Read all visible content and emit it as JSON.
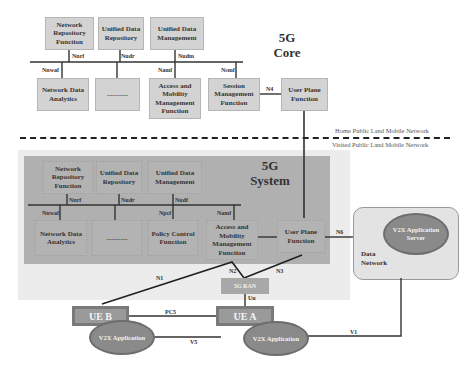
{
  "core": {
    "title_line1": "5G",
    "title_line2": "Core",
    "nrf": "Network Repository Function",
    "udr": "Unified Data Repository",
    "udm": "Unified Data Management",
    "nwdaf": "Network Data Analytics",
    "dots": "............",
    "amf": "Access and Mobility Management Function",
    "smf": "Session Management Function",
    "upf": "User Plane Function",
    "interfaces": {
      "nnrf": "Nnrf",
      "nudr": "Nudr",
      "nudm": "Nudm",
      "nnwaf": "Nnwaf",
      "namf": "Namf",
      "nsmf": "Nsmf",
      "n4": "N4"
    }
  },
  "boundary": {
    "home": "Home Public Land Mobile Network",
    "visited": "Visited Public Land Mobile Network"
  },
  "system": {
    "title_line1": "5G",
    "title_line2": "System",
    "nrf": "Network Repository Function",
    "udr": "Unified Data Repository",
    "udm": "Unified Data Management",
    "nwdaf": "Network Data Analytics",
    "dots": "............",
    "pcf": "Policy Control Function",
    "amf": "Access and Mobility Management Function",
    "upf": "User Plane Function",
    "interfaces": {
      "nnrf": "Nnrf",
      "nudr": "Nudr",
      "nudf": "Nudf",
      "nnwaf": "Nnwaf",
      "npcf": "Npcf",
      "namf": "Namf",
      "n6": "N6",
      "n1": "N1",
      "n2": "N2",
      "n3": "N3",
      "uu": "Uu",
      "pc5": "PC5",
      "v5": "V5",
      "v1": "V1"
    }
  },
  "data_network": {
    "label": "Data Network",
    "server": "V2X Application Server"
  },
  "ran": "5G RAN",
  "ue_b": "UE B",
  "ue_a": "UE A",
  "app_b": "V2X Application",
  "app_a": "V2X Application"
}
